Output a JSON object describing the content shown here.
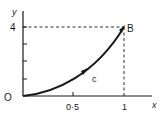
{
  "diagram": {
    "axes": {
      "x_label": "x",
      "y_label": "y",
      "origin_label": "O"
    },
    "ticks": {
      "x": [
        {
          "value": 0.5,
          "label": "0·5"
        },
        {
          "value": 1,
          "label": "1"
        }
      ],
      "y": [
        {
          "value": 1,
          "label": ""
        },
        {
          "value": 2,
          "label": ""
        },
        {
          "value": 3,
          "label": ""
        },
        {
          "value": 4,
          "label": "4"
        }
      ]
    },
    "points": [
      {
        "name": "O",
        "x": 0,
        "y": 0
      },
      {
        "name": "B",
        "x": 1,
        "y": 4
      }
    ],
    "curve": {
      "label": "c",
      "from": "O",
      "to": "B",
      "direction_arrow": true,
      "description": "curved path from O to B, concave up"
    },
    "guides": {
      "dashed_horizontal": "y = 4 from y-axis to B",
      "dashed_vertical": "x = 1 from B down to x-axis"
    },
    "colors": {
      "ink": "#1a1a1a",
      "background": "#ffffff"
    }
  }
}
